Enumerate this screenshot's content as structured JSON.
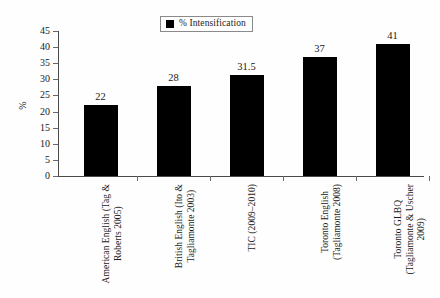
{
  "chart_data": {
    "type": "bar",
    "title": "",
    "xlabel": "",
    "ylabel": "%",
    "ylim": [
      0,
      45
    ],
    "ytick_step": 5,
    "grid": false,
    "legend_position": "top-center",
    "bar_color": "#000000",
    "categories": [
      "American English (Tag & Roberts 2005)",
      "British English (Ito & Tagliamonte 2003)",
      "TIC (2009–2010)",
      "Toronto English (Tagliamonte 2008)",
      "Toronto GLBQ (Tagliamonte & Uscher 2009)"
    ],
    "category_lines": [
      [
        "American English (Tag &",
        "Roberts 2005)"
      ],
      [
        "British English (Ito &",
        "Tagliamonte 2003)"
      ],
      [
        "TIC (2009–2010)",
        ""
      ],
      [
        "Toronto English",
        "(Tagliamonte 2008)"
      ],
      [
        "Toronto GLBQ",
        "(Tagliamonte & Uscher",
        "2009)"
      ]
    ],
    "series": [
      {
        "name": "% Intensification",
        "values": [
          22,
          28,
          31.5,
          37,
          41
        ]
      }
    ],
    "value_labels": [
      "22",
      "28",
      "31.5",
      "37",
      "41"
    ],
    "ytick_labels": [
      "45",
      "40",
      "35",
      "30",
      "25",
      "20",
      "15",
      "10",
      "5",
      "0"
    ]
  },
  "legend": {
    "entries": [
      {
        "label": "% Intensification",
        "color": "#000000"
      }
    ]
  }
}
